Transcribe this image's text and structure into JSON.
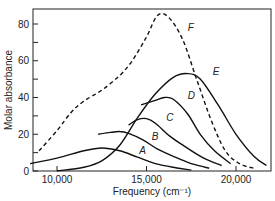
{
  "chart_data": {
    "type": "line",
    "title": "",
    "xlabel": "Frequency (cm⁻¹)",
    "ylabel": "Molar absorbance",
    "xlim": [
      8500,
      22000
    ],
    "ylim": [
      0,
      88
    ],
    "x_ticks": [
      "10,000",
      "15,000",
      "20,000"
    ],
    "y_ticks": [
      "0",
      "20",
      "40",
      "60",
      "80"
    ],
    "grid": false,
    "legend": "inline curve labels",
    "series": [
      {
        "name": "A",
        "style": "solid",
        "points": [
          [
            8500,
            4
          ],
          [
            10000,
            7
          ],
          [
            11500,
            11
          ],
          [
            12500,
            12.5
          ],
          [
            13500,
            11
          ],
          [
            14500,
            7.5
          ],
          [
            15500,
            4
          ],
          [
            16500,
            2
          ],
          [
            17500,
            0.5
          ]
        ]
      },
      {
        "name": "B",
        "style": "solid",
        "points": [
          [
            12300,
            20
          ],
          [
            13000,
            21
          ],
          [
            13500,
            21.5
          ],
          [
            14000,
            20.5
          ],
          [
            14800,
            17
          ],
          [
            15600,
            12
          ],
          [
            16500,
            8
          ],
          [
            17500,
            4
          ],
          [
            18500,
            1.5
          ]
        ]
      },
      {
        "name": "C",
        "style": "solid",
        "points": [
          [
            14000,
            25
          ],
          [
            14500,
            28
          ],
          [
            15000,
            28.5
          ],
          [
            15500,
            26
          ],
          [
            16300,
            19
          ],
          [
            17200,
            13
          ],
          [
            18200,
            7
          ],
          [
            19200,
            3
          ]
        ]
      },
      {
        "name": "D",
        "style": "solid",
        "points": [
          [
            14700,
            36
          ],
          [
            15500,
            38.5
          ],
          [
            16000,
            40
          ],
          [
            16500,
            39
          ],
          [
            17300,
            31
          ],
          [
            18000,
            20
          ],
          [
            18800,
            11
          ],
          [
            19700,
            4
          ]
        ]
      },
      {
        "name": "E",
        "style": "solid",
        "points": [
          [
            10000,
            0
          ],
          [
            11500,
            2
          ],
          [
            12500,
            5.5
          ],
          [
            13500,
            14
          ],
          [
            14500,
            29
          ],
          [
            15500,
            42
          ],
          [
            16500,
            51
          ],
          [
            17300,
            53
          ],
          [
            18000,
            50
          ],
          [
            19000,
            36
          ],
          [
            20000,
            20
          ],
          [
            21000,
            8
          ],
          [
            21700,
            3
          ]
        ]
      },
      {
        "name": "F",
        "style": "dashed",
        "points": [
          [
            9000,
            11
          ],
          [
            10000,
            22
          ],
          [
            10800,
            32
          ],
          [
            11500,
            38
          ],
          [
            12500,
            44
          ],
          [
            13500,
            52
          ],
          [
            14200,
            60
          ],
          [
            15000,
            73
          ],
          [
            15600,
            84.5
          ],
          [
            16200,
            84
          ],
          [
            17000,
            72
          ],
          [
            17800,
            50
          ],
          [
            18600,
            28
          ],
          [
            19400,
            11
          ],
          [
            20200,
            4
          ],
          [
            21000,
            1.5
          ]
        ]
      }
    ],
    "annotations": [
      {
        "text": "A",
        "x": 14600,
        "y": 9.5
      },
      {
        "text": "B",
        "x": 15300,
        "y": 17
      },
      {
        "text": "C",
        "x": 16100,
        "y": 27
      },
      {
        "text": "D",
        "x": 17300,
        "y": 39
      },
      {
        "text": "E",
        "x": 18700,
        "y": 52
      },
      {
        "text": "F",
        "x": 17300,
        "y": 76
      }
    ]
  }
}
